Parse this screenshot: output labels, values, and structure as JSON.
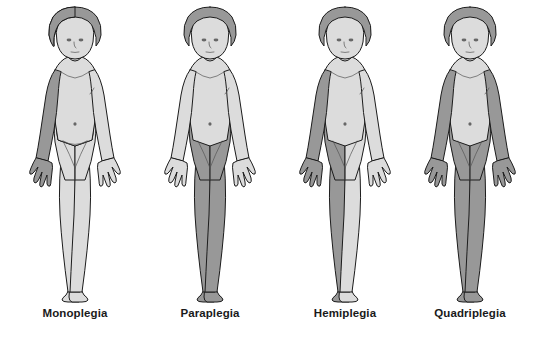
{
  "diagram": {
    "background_color": "#ffffff",
    "colors": {
      "affected_fill": "#989898",
      "unaffected_fill": "#dcdcdc",
      "hair_fill": "#989898",
      "outline": "#1c1c1c",
      "label_color": "#1a1a1a"
    },
    "figures": [
      {
        "id": "monoplegia",
        "label": "Monoplegia",
        "affected_regions": [
          "right-arm"
        ],
        "affected_description": "One limb affected: a single arm (shown on the viewer's left)",
        "center_x": 75
      },
      {
        "id": "paraplegia",
        "label": "Paraplegia",
        "affected_regions": [
          "left-leg",
          "right-leg"
        ],
        "affected_description": "Both legs affected from the hips downward",
        "center_x": 210
      },
      {
        "id": "hemiplegia",
        "label": "Hemiplegia",
        "affected_regions": [
          "right-arm",
          "right-leg"
        ],
        "affected_description": "One entire side of the body affected: arm and leg together",
        "center_x": 345
      },
      {
        "id": "quadriplegia",
        "label": "Quadriplegia",
        "affected_regions": [
          "left-arm",
          "right-arm",
          "left-leg",
          "right-leg"
        ],
        "affected_description": "All four limbs affected: both arms and both legs",
        "center_x": 470
      }
    ]
  }
}
